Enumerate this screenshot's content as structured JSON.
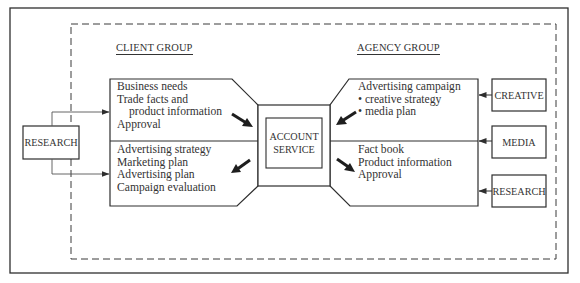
{
  "diagram": {
    "client_group": {
      "heading": "CLIENT GROUP",
      "inputs_to_account": [
        "Business needs",
        "Trade facts and",
        "product information",
        "Approval"
      ],
      "outputs_from_account": [
        "Advertising strategy",
        "Marketing plan",
        "Advertising plan",
        "Campaign evaluation"
      ]
    },
    "agency_group": {
      "heading": "AGENCY GROUP",
      "inputs_to_account": [
        "Advertising campaign",
        "• creative strategy",
        "• media plan"
      ],
      "outputs_from_account": [
        "Fact book",
        "Product information",
        "Approval"
      ]
    },
    "center": {
      "line1": "ACCOUNT",
      "line2": "SERVICE"
    },
    "external_left": {
      "research": "RESEARCH"
    },
    "external_right": {
      "creative": "CREATIVE",
      "media": "MEDIA",
      "research": "RESEARCH"
    },
    "colors": {
      "line": "#2e2e2e",
      "background": "#ffffff",
      "text": "#333333"
    }
  }
}
